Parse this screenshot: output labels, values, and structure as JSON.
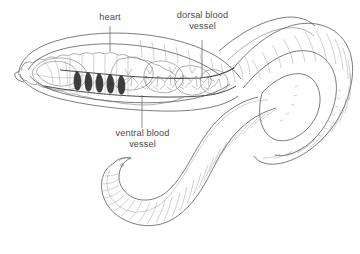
{
  "figure": {
    "style": "black-and-white line drawing",
    "background_color": "#ffffff",
    "line_color": "#555555",
    "accent_dark": "#3a3a3a",
    "label_color": "#4a4a4a"
  },
  "labels": [
    {
      "id": "heart",
      "text": "heart",
      "lines": [
        "heart"
      ],
      "x": 110,
      "y": 18,
      "leader": {
        "x1": 110,
        "y1": 26,
        "x2": 110,
        "y2": 52
      }
    },
    {
      "id": "dorsal-blood-vessel",
      "text": "dorsal blood vessel",
      "lines": [
        "dorsal blood",
        "vessel"
      ],
      "x": 202,
      "y": 16,
      "leader": {
        "x1": 202,
        "y1": 40,
        "x2": 202,
        "y2": 77
      }
    },
    {
      "id": "ventral-blood-vessel",
      "text": "ventral blood vessel",
      "lines": [
        "ventral blood",
        "vessel"
      ],
      "x": 142,
      "y": 134,
      "leader": {
        "x1": 142,
        "y1": 95,
        "x2": 142,
        "y2": 128
      }
    }
  ],
  "label_lines": {
    "heart": "heart",
    "dorsal_1": "dorsal blood",
    "dorsal_2": "vessel",
    "ventral_1": "ventral blood",
    "ventral_2": "vessel"
  },
  "anatomy": {
    "parts": [
      "anterior dissected body wall",
      "aortic arches (hearts)",
      "dorsal blood vessel",
      "ventral blood vessel",
      "capillary branches",
      "segmented body",
      "posterior tail"
    ],
    "heart_count": 5
  }
}
